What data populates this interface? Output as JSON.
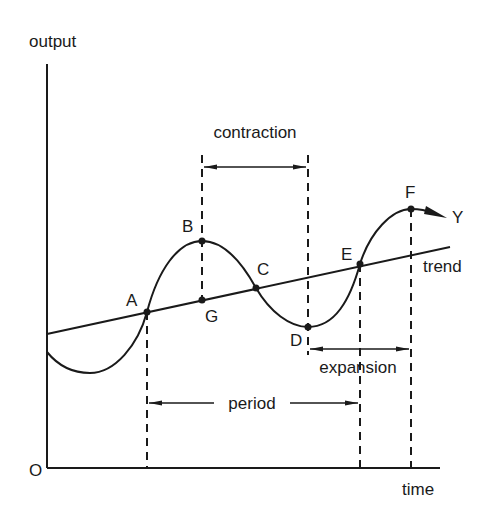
{
  "diagram": {
    "type": "business-cycle",
    "axes": {
      "y_label": "output",
      "x_label": "time",
      "origin_label": "O"
    },
    "lines": {
      "trend_label": "trend",
      "curve_label": "Y"
    },
    "points": [
      {
        "id": "A",
        "label": "A",
        "x": 147,
        "y": 312
      },
      {
        "id": "B",
        "label": "B",
        "x": 202,
        "y": 241
      },
      {
        "id": "C",
        "label": "C",
        "x": 256,
        "y": 288
      },
      {
        "id": "D",
        "label": "D",
        "x": 308,
        "y": 327
      },
      {
        "id": "E",
        "label": "E",
        "x": 360,
        "y": 264
      },
      {
        "id": "F",
        "label": "F",
        "x": 411,
        "y": 209
      },
      {
        "id": "G",
        "label": "G",
        "x": 202,
        "y": 300
      }
    ],
    "spans": {
      "contraction": {
        "label": "contraction",
        "from": "B",
        "to": "D"
      },
      "expansion": {
        "label": "expansion",
        "from": "D",
        "to": "F"
      },
      "period": {
        "label": "period",
        "from": "A",
        "to": "E"
      }
    },
    "colors": {
      "ink": "#1a1a1a",
      "background": "#ffffff"
    }
  }
}
